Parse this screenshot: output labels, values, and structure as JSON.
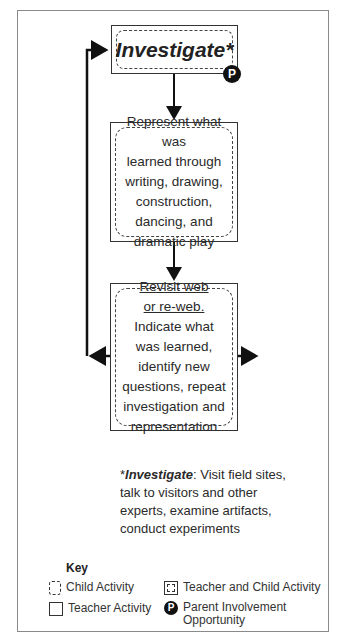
{
  "diagram": {
    "steps": [
      {
        "title": "Investigate*",
        "badge": "P"
      },
      {
        "text_lines": [
          "Represent what was",
          "learned through",
          "writing, drawing,",
          "construction,",
          "dancing, and",
          "dramatic play"
        ]
      },
      {
        "underlined_lines": [
          "Revisit web",
          "or re-web."
        ],
        "text_lines": [
          "Indicate what",
          "was learned,",
          "identify new",
          "questions, repeat",
          "investigation and",
          "representation"
        ]
      }
    ],
    "footnote": {
      "asterisk": "*",
      "term": "Investigate",
      "colon": ":",
      "text": " Visit field sites, talk to visitors and other experts, examine artifacts, conduct experiments"
    },
    "key": {
      "title": "Key",
      "items": [
        {
          "icon": "dashed-rounded-box",
          "label": "Child Activity"
        },
        {
          "icon": "double-box",
          "label": "Teacher and Child Activity"
        },
        {
          "icon": "solid-box",
          "label": "Teacher Activity"
        },
        {
          "icon": "P-circle",
          "label_lines": [
            "Parent Involvement",
            "Opportunity"
          ]
        }
      ]
    }
  }
}
